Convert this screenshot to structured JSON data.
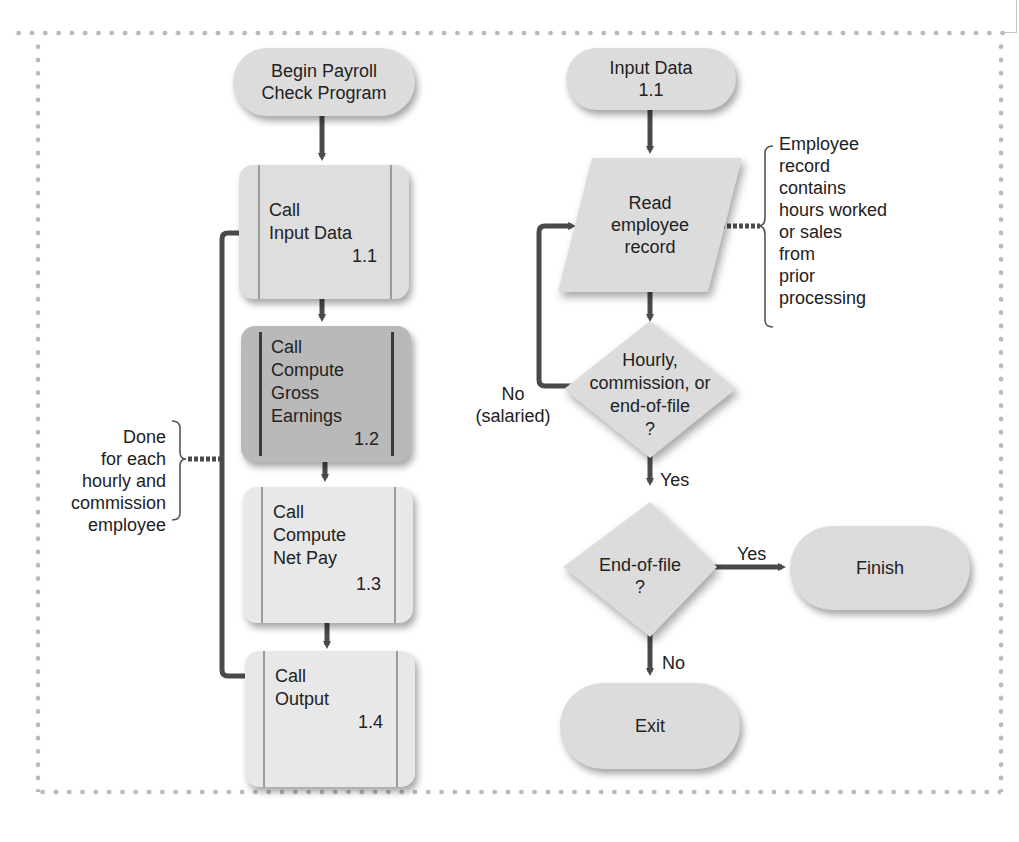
{
  "header": {
    "caption": ""
  },
  "colors": {
    "shape_fill": "#dcdcdc",
    "dark_module_fill": "#b9b9b9",
    "line": "#4a4a4a",
    "border_dots": "#b9b9b9"
  },
  "left_chart": {
    "start": {
      "line1": "Begin Payroll",
      "line2": "Check Program"
    },
    "modules": [
      {
        "lines": [
          "Call",
          "Input Data"
        ],
        "number": "1.1"
      },
      {
        "lines": [
          "Call",
          "Compute",
          "Gross",
          "Earnings"
        ],
        "number": "1.2"
      },
      {
        "lines": [
          "Call",
          "Compute",
          "Net Pay"
        ],
        "number": "1.3"
      },
      {
        "lines": [
          "Call",
          "Output"
        ],
        "number": "1.4"
      }
    ],
    "loop_annotation": [
      "Done",
      "for each",
      "hourly and",
      "commission",
      "employee"
    ]
  },
  "right_chart": {
    "start": {
      "line1": "Input Data",
      "line2": "1.1"
    },
    "read": {
      "lines": [
        "Read",
        "employee",
        "record"
      ]
    },
    "read_annotation": [
      "Employee",
      "record",
      "contains",
      "hours worked",
      "or sales",
      "from",
      "prior",
      "processing"
    ],
    "decision1": {
      "lines": [
        "Hourly,",
        "commission, or",
        "end-of-file",
        "?"
      ],
      "no_label": [
        "No",
        "(salaried)"
      ],
      "yes_label": "Yes"
    },
    "decision2": {
      "lines": [
        "End-of-file",
        "?"
      ],
      "yes_label": "Yes",
      "no_label": "No"
    },
    "finish": "Finish",
    "exit": "Exit"
  }
}
